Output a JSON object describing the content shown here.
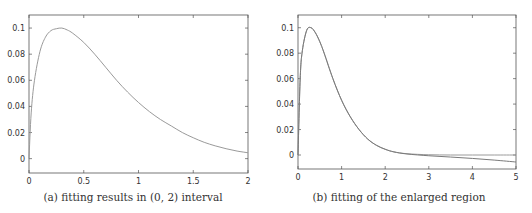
{
  "chart_data": [
    {
      "type": "line",
      "title": "",
      "caption": "(a) fitting results in (0, 2) interval",
      "xlabel": "",
      "ylabel": "",
      "xlim": [
        0,
        2
      ],
      "ylim": [
        -0.011,
        0.11
      ],
      "x_ticks": [
        "0",
        "0.5",
        "1",
        "1.5",
        "2"
      ],
      "y_ticks": [
        "0",
        "0.02",
        "0.04",
        "0.06",
        "0.08",
        "0.1"
      ],
      "grid": false,
      "legend": null,
      "series": [
        {
          "name": "fitted curve",
          "color": "#9a9a9a",
          "x": [
            0,
            0.02,
            0.05,
            0.1,
            0.15,
            0.2,
            0.25,
            0.3,
            0.35,
            0.4,
            0.5,
            0.6,
            0.7,
            0.8,
            0.9,
            1.0,
            1.1,
            1.2,
            1.3,
            1.4,
            1.5,
            1.6,
            1.7,
            1.8,
            1.9,
            2.0
          ],
          "y": [
            0,
            0.035,
            0.06,
            0.082,
            0.093,
            0.098,
            0.0995,
            0.1,
            0.0985,
            0.096,
            0.089,
            0.08,
            0.07,
            0.06,
            0.051,
            0.043,
            0.036,
            0.03,
            0.025,
            0.02,
            0.016,
            0.0125,
            0.0098,
            0.0076,
            0.0058,
            0.0045
          ]
        }
      ]
    },
    {
      "type": "line",
      "title": "",
      "caption": "(b) fitting of the enlarged region",
      "xlabel": "",
      "ylabel": "",
      "xlim": [
        0,
        5
      ],
      "ylim": [
        -0.011,
        0.11
      ],
      "x_ticks": [
        "0",
        "1",
        "2",
        "3",
        "4",
        "5"
      ],
      "y_ticks": [
        "0",
        "0.02",
        "0.04",
        "0.06",
        "0.08",
        "0.1"
      ],
      "grid": false,
      "legend": null,
      "series": [
        {
          "name": "true curve",
          "color": "#9a9a9a",
          "x": [
            0,
            0.05,
            0.1,
            0.2,
            0.3,
            0.4,
            0.5,
            0.6,
            0.8,
            1.0,
            1.2,
            1.4,
            1.6,
            1.8,
            2.0,
            2.2,
            2.5,
            3.0,
            3.5,
            4.0,
            4.5,
            5.0
          ],
          "y": [
            0,
            0.06,
            0.082,
            0.098,
            0.1,
            0.096,
            0.089,
            0.08,
            0.06,
            0.043,
            0.03,
            0.02,
            0.0125,
            0.0076,
            0.0045,
            0.0025,
            0.001,
            0.0002,
            0.0,
            0.0,
            0.0,
            0.0
          ]
        },
        {
          "name": "fitted curve",
          "color": "#7a7a7a",
          "x": [
            0,
            0.05,
            0.1,
            0.2,
            0.3,
            0.4,
            0.5,
            0.6,
            0.8,
            1.0,
            1.2,
            1.4,
            1.6,
            1.8,
            2.0,
            2.2,
            2.5,
            3.0,
            3.5,
            4.0,
            4.5,
            5.0
          ],
          "y": [
            0,
            0.06,
            0.082,
            0.098,
            0.1,
            0.096,
            0.089,
            0.08,
            0.06,
            0.043,
            0.03,
            0.02,
            0.0125,
            0.0076,
            0.0045,
            0.0024,
            0.0008,
            -0.0006,
            -0.0016,
            -0.0027,
            -0.004,
            -0.0055
          ]
        }
      ]
    }
  ]
}
